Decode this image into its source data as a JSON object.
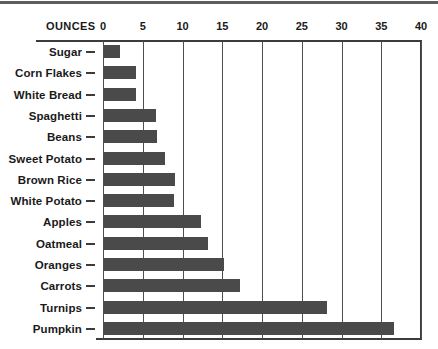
{
  "chart_data": {
    "type": "bar",
    "orientation": "horizontal",
    "title": "",
    "xlabel": "OUNCES",
    "ylabel": "",
    "xlim": [
      0,
      40
    ],
    "xticks": [
      0,
      5,
      10,
      15,
      20,
      25,
      30,
      35,
      40
    ],
    "grid": true,
    "legend": false,
    "bar_color": "#4a4a4a",
    "axis_color": "#3c3c3c",
    "categories": [
      "Sugar",
      "Corn Flakes",
      "White Bread",
      "Spaghetti",
      "Beans",
      "Sweet Potato",
      "Brown Rice",
      "White Potato",
      "Apples",
      "Oatmeal",
      "Oranges",
      "Carrots",
      "Turnips",
      "Pumpkin"
    ],
    "values": [
      2,
      4,
      4,
      6.5,
      6.7,
      7.7,
      8.9,
      8.8,
      12.2,
      13.1,
      15.1,
      17.1,
      28,
      36.5
    ]
  }
}
